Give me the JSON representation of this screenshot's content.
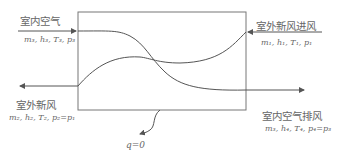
{
  "diagram": {
    "title": "",
    "streams": {
      "indoor_in": {
        "label": "室内空气",
        "props": "m₃, h₃, T₃, p₃"
      },
      "outdoor_in": {
        "label": "室外新风进风",
        "props": "m₁, h₁, T₁, p₁"
      },
      "supply_out": {
        "label": "室外新风",
        "props": "m₂, h₂, T₂, p₂=p₁"
      },
      "exhaust_out": {
        "label": "室内空气排风",
        "props": "m₃, h₄, T₄, p₄=p₃"
      }
    },
    "heat_loss": "q=0",
    "colors": {
      "line": "#555555",
      "box": "#777777"
    }
  }
}
